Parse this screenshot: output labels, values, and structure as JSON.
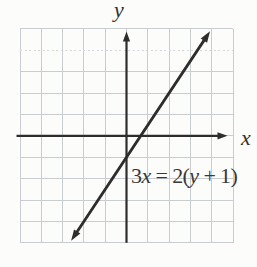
{
  "figure": {
    "background": "#fcfcfb",
    "grid_color": "#c9cdd0",
    "grid_dotted_color": "#d6d9db",
    "axis_color": "#2e2d2c",
    "line_color": "#2e2d2c",
    "text_color": "#3a3938"
  },
  "chart_data": {
    "type": "line",
    "title": "",
    "xlabel": "x",
    "ylabel": "y",
    "x_range": [
      -5,
      5
    ],
    "y_range": [
      -5,
      5
    ],
    "grid": true,
    "grid_cells": [
      10,
      10
    ],
    "legend_position": "none",
    "equation_label": "3x = 2(y + 1)",
    "series": [
      {
        "name": "3x = 2(y + 1)",
        "slope": 1.5,
        "y_intercept": -1,
        "x_intercept": 0.667,
        "segment": {
          "x1": -2.6,
          "x2": 3.92
        },
        "points": [
          [
            -2,
            -4
          ],
          [
            0,
            -1
          ],
          [
            2,
            2
          ]
        ],
        "arrowheads": "both"
      }
    ]
  }
}
